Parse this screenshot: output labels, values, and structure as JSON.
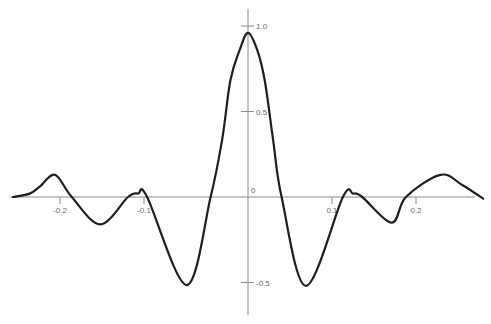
{
  "chart_data": {
    "type": "line",
    "title": "",
    "xlabel": "",
    "ylabel": "",
    "xlim": [
      -0.26,
      0.27
    ],
    "ylim": [
      -0.69,
      1.1
    ],
    "grid": false,
    "legend": null,
    "x_ticks": [
      {
        "value": -0.2,
        "label": "-0.2"
      },
      {
        "value": -0.1,
        "label": "-0.1"
      },
      {
        "value": 0.1,
        "label": "0.1"
      },
      {
        "value": 0.2,
        "label": "0.2"
      }
    ],
    "y_ticks": [
      {
        "value": 1.0,
        "label": "1.0"
      },
      {
        "value": 0.5,
        "label": "0.5"
      },
      {
        "value": -0.5,
        "label": "-0.5"
      }
    ],
    "origin_label": "0",
    "series": [
      {
        "name": "response",
        "color": "#1e1e1e",
        "x": [
          -0.256,
          -0.236,
          -0.224,
          -0.206,
          -0.186,
          -0.152,
          -0.119,
          -0.107,
          -0.097,
          -0.059,
          -0.036,
          -0.025,
          -0.017,
          -0.008,
          0.0,
          0.011,
          0.02,
          0.03,
          0.04,
          0.069,
          0.113,
          0.125,
          0.136,
          0.171,
          0.188,
          0.229,
          0.255,
          0.28
        ],
        "y": [
          0.0,
          0.02,
          0.06,
          0.13,
          0.0,
          -0.16,
          0.0,
          0.02,
          0.0,
          -0.515,
          0.0,
          0.33,
          0.68,
          0.86,
          0.96,
          0.86,
          0.68,
          0.33,
          0.0,
          -0.52,
          0.0,
          0.02,
          0.0,
          -0.15,
          0.0,
          0.13,
          0.07,
          -0.01
        ]
      }
    ]
  }
}
